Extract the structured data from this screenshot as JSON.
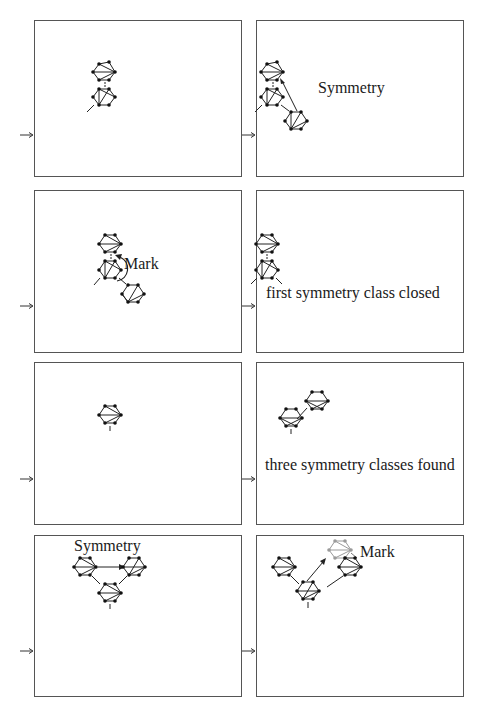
{
  "figure": {
    "panels": [
      {
        "id": 1,
        "label": "",
        "step": "initial two-node chain"
      },
      {
        "id": 2,
        "label": "Symmetry",
        "step": "symmetry edge detected from new node back to root"
      },
      {
        "id": 3,
        "label": "Mark",
        "step": "mark applied via curved arrow"
      },
      {
        "id": 4,
        "label": "first symmetry class closed",
        "step": "class closed, chain remains"
      },
      {
        "id": 5,
        "label": "",
        "step": "single node"
      },
      {
        "id": 6,
        "label": "three symmetry classes found",
        "step": "two nodes connected diagonally"
      },
      {
        "id": 7,
        "label": "Symmetry",
        "step": "three-node triangle with symmetry arrow"
      },
      {
        "id": 8,
        "label": "Mark",
        "step": "gray marked node added above"
      }
    ],
    "colors": {
      "border": "#555555",
      "ink": "#1a1a1a",
      "marked_node": "#9a9a9a",
      "background": "#ffffff"
    },
    "entry_arrow_icon": "right-arrow-icon"
  }
}
